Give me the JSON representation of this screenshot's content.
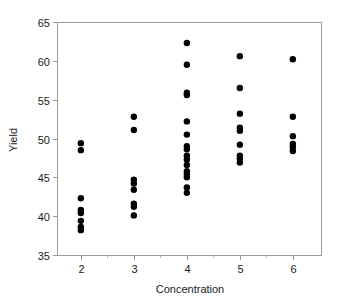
{
  "chart_data": {
    "type": "scatter",
    "title": "",
    "xlabel": "Concentration",
    "ylabel": "Yield",
    "xlim": [
      1.55,
      6.55
    ],
    "ylim": [
      35,
      65
    ],
    "xticks": [
      2,
      3,
      4,
      5,
      6
    ],
    "yticks": [
      35,
      40,
      45,
      50,
      55,
      60,
      65
    ],
    "xticklabels": [
      "2",
      "3",
      "4",
      "5",
      "6"
    ],
    "yticklabels": [
      "35",
      "40",
      "45",
      "50",
      "55",
      "60",
      "65"
    ],
    "minor_xticks": [
      2.5,
      3.5,
      4.5,
      5.5
    ],
    "grid": false,
    "legend": null,
    "marker": "circle",
    "marker_color": "#000000",
    "marker_size": 4,
    "frame": [
      "left",
      "bottom",
      "top",
      "right"
    ],
    "points": [
      {
        "x": 2,
        "y": 49.4
      },
      {
        "x": 2,
        "y": 48.5
      },
      {
        "x": 2,
        "y": 42.3
      },
      {
        "x": 2,
        "y": 40.8
      },
      {
        "x": 2,
        "y": 40.4
      },
      {
        "x": 2,
        "y": 39.4
      },
      {
        "x": 2,
        "y": 38.6
      },
      {
        "x": 2,
        "y": 38.2
      },
      {
        "x": 3,
        "y": 52.8
      },
      {
        "x": 3,
        "y": 51.1
      },
      {
        "x": 3,
        "y": 44.7
      },
      {
        "x": 3,
        "y": 44.2
      },
      {
        "x": 3,
        "y": 43.4
      },
      {
        "x": 3,
        "y": 41.6
      },
      {
        "x": 3,
        "y": 41.2
      },
      {
        "x": 3,
        "y": 40.1
      },
      {
        "x": 4,
        "y": 62.3
      },
      {
        "x": 4,
        "y": 59.5
      },
      {
        "x": 4,
        "y": 55.9
      },
      {
        "x": 4,
        "y": 55.6
      },
      {
        "x": 4,
        "y": 52.2
      },
      {
        "x": 4,
        "y": 50.5
      },
      {
        "x": 4,
        "y": 49.0
      },
      {
        "x": 4,
        "y": 48.6
      },
      {
        "x": 4,
        "y": 47.8
      },
      {
        "x": 4,
        "y": 47.3
      },
      {
        "x": 4,
        "y": 46.6
      },
      {
        "x": 4,
        "y": 45.8
      },
      {
        "x": 4,
        "y": 45.4
      },
      {
        "x": 4,
        "y": 45.0
      },
      {
        "x": 4,
        "y": 43.7
      },
      {
        "x": 4,
        "y": 43.0
      },
      {
        "x": 5,
        "y": 60.6
      },
      {
        "x": 5,
        "y": 56.5
      },
      {
        "x": 5,
        "y": 53.2
      },
      {
        "x": 5,
        "y": 51.4
      },
      {
        "x": 5,
        "y": 51.0
      },
      {
        "x": 5,
        "y": 49.2
      },
      {
        "x": 5,
        "y": 47.8
      },
      {
        "x": 5,
        "y": 47.4
      },
      {
        "x": 5,
        "y": 46.9
      },
      {
        "x": 6,
        "y": 60.2
      },
      {
        "x": 6,
        "y": 52.8
      },
      {
        "x": 6,
        "y": 50.3
      },
      {
        "x": 6,
        "y": 49.3
      },
      {
        "x": 6,
        "y": 48.9
      },
      {
        "x": 6,
        "y": 48.4
      }
    ]
  },
  "geometry": {
    "plot_left": 57,
    "plot_right": 322,
    "plot_top": 22,
    "plot_bottom": 255
  }
}
